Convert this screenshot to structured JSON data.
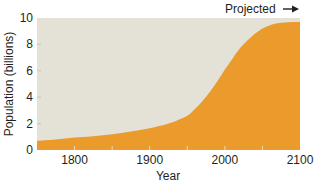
{
  "chart_data": {
    "type": "area",
    "title": "",
    "xlabel": "Year",
    "ylabel": "Population (billions)",
    "xlim": [
      1750,
      2100
    ],
    "ylim": [
      0,
      10
    ],
    "x_ticks": [
      1800,
      1900,
      2000,
      2100
    ],
    "y_ticks": [
      0,
      2,
      4,
      6,
      8,
      10
    ],
    "grid": false,
    "legend": null,
    "annotations": [
      {
        "text": "Projected →",
        "position": "top-right",
        "applies_to_x_from": 2020
      }
    ],
    "series": [
      {
        "name": "World population",
        "x": [
          1750,
          1775,
          1800,
          1825,
          1850,
          1875,
          1900,
          1925,
          1950,
          1960,
          1970,
          1980,
          1990,
          2000,
          2010,
          2020,
          2030,
          2040,
          2050,
          2060,
          2070,
          2080,
          2090,
          2100
        ],
        "values": [
          0.7,
          0.8,
          0.95,
          1.05,
          1.2,
          1.4,
          1.65,
          2.0,
          2.6,
          3.1,
          3.7,
          4.4,
          5.2,
          6.1,
          6.9,
          7.7,
          8.3,
          8.8,
          9.2,
          9.45,
          9.6,
          9.65,
          9.7,
          9.7
        ]
      }
    ],
    "colors": {
      "area_fill": "#eb9a2c",
      "plot_background": "#e4e2d6"
    }
  },
  "labels": {
    "projected": "Projected",
    "xlabel": "Year",
    "ylabel": "Population (billions)"
  }
}
